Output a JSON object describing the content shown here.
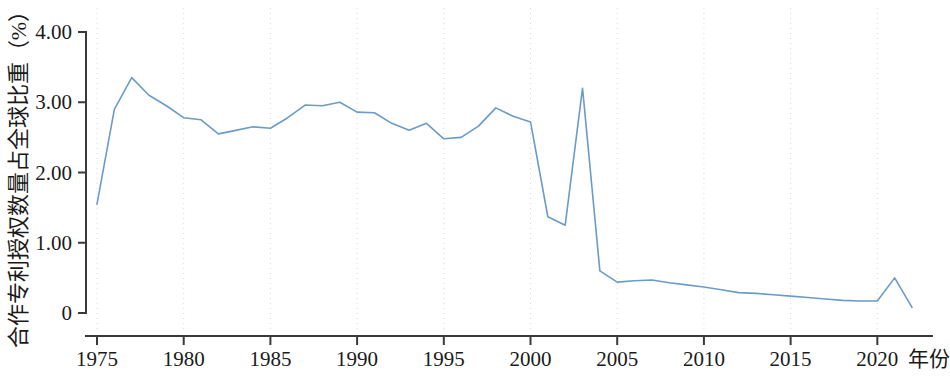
{
  "chart_data": {
    "type": "line",
    "title": "",
    "subtitle": "",
    "xlabel": "年份",
    "ylabel": "合作专利授权数量占全球比重（%）",
    "xlim": [
      1975,
      2022
    ],
    "ylim": [
      0,
      4.0
    ],
    "grid": "vertical-dotted-at-xticks",
    "legend": "none",
    "line_color": "#6b9bc8",
    "axis_color": "#3a3a3a",
    "grid_color": "#d8d8d8",
    "x_ticks": [
      1975,
      1980,
      1985,
      1990,
      1995,
      2000,
      2005,
      2010,
      2015,
      2020
    ],
    "x_tick_labels": [
      "1975",
      "1980",
      "1985",
      "1990",
      "1995",
      "2000",
      "2005",
      "2010",
      "2015",
      "2020"
    ],
    "y_ticks": [
      0,
      1.0,
      2.0,
      3.0,
      4.0
    ],
    "y_tick_labels": [
      "0",
      "1.00",
      "2.00",
      "3.00",
      "4.00"
    ],
    "series": [
      {
        "name": "合作专利授权数量占全球比重",
        "x": [
          1975,
          1976,
          1977,
          1978,
          1979,
          1980,
          1981,
          1982,
          1983,
          1984,
          1985,
          1986,
          1987,
          1988,
          1989,
          1990,
          1991,
          1992,
          1993,
          1994,
          1995,
          1996,
          1997,
          1998,
          1999,
          2000,
          2001,
          2002,
          2003,
          2004,
          2005,
          2006,
          2007,
          2008,
          2009,
          2010,
          2011,
          2012,
          2013,
          2014,
          2015,
          2016,
          2017,
          2018,
          2019,
          2020,
          2021,
          2022
        ],
        "values": [
          1.55,
          2.9,
          3.35,
          3.1,
          2.95,
          2.78,
          2.75,
          2.55,
          2.6,
          2.65,
          2.63,
          2.78,
          2.96,
          2.95,
          3.0,
          2.86,
          2.85,
          2.7,
          2.6,
          2.7,
          2.48,
          2.5,
          2.66,
          2.92,
          2.8,
          2.72,
          1.37,
          1.25,
          3.2,
          0.6,
          0.44,
          0.46,
          0.47,
          0.43,
          0.4,
          0.37,
          0.33,
          0.29,
          0.28,
          0.26,
          0.24,
          0.22,
          0.2,
          0.18,
          0.17,
          0.17,
          0.5,
          0.08
        ]
      }
    ]
  },
  "axis": {
    "y_title": "合作专利授权数量占全球比重（%）",
    "x_title": "年份"
  }
}
